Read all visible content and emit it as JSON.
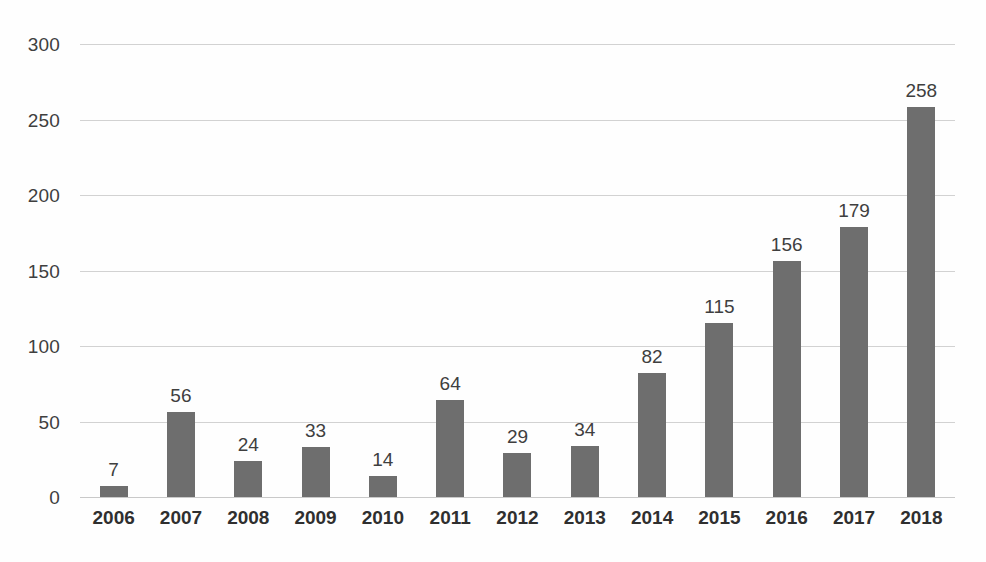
{
  "chart_data": {
    "type": "bar",
    "title": "",
    "subtitle": "",
    "xlabel": "",
    "ylabel": "",
    "categories": [
      "2006",
      "2007",
      "2008",
      "2009",
      "2010",
      "2011",
      "2012",
      "2013",
      "2014",
      "2015",
      "2016",
      "2017",
      "2018"
    ],
    "values": [
      7,
      56,
      24,
      33,
      14,
      64,
      29,
      34,
      82,
      115,
      156,
      179,
      258
    ],
    "data_labels": [
      "7",
      "56",
      "24",
      "33",
      "14",
      "64",
      "29",
      "34",
      "82",
      "115",
      "156",
      "179",
      "258"
    ],
    "ylim": [
      0,
      300
    ],
    "ytick_values": [
      300,
      250,
      200,
      150,
      100,
      50,
      0
    ],
    "ytick_labels": [
      "300",
      "250",
      "200",
      "150",
      "100",
      "50",
      "0"
    ],
    "grid": true,
    "grid_axis": "y",
    "legend": false,
    "legend_position": "none",
    "show_data_labels": true,
    "colors": {
      "bar_fill": "#6e6e6e",
      "gridline": "#d2d2d2",
      "axis_line": "#c9c9c9",
      "tick_text": "#3f3f3f",
      "category_text": "#2f2f2f",
      "background": "#fefefe"
    }
  }
}
